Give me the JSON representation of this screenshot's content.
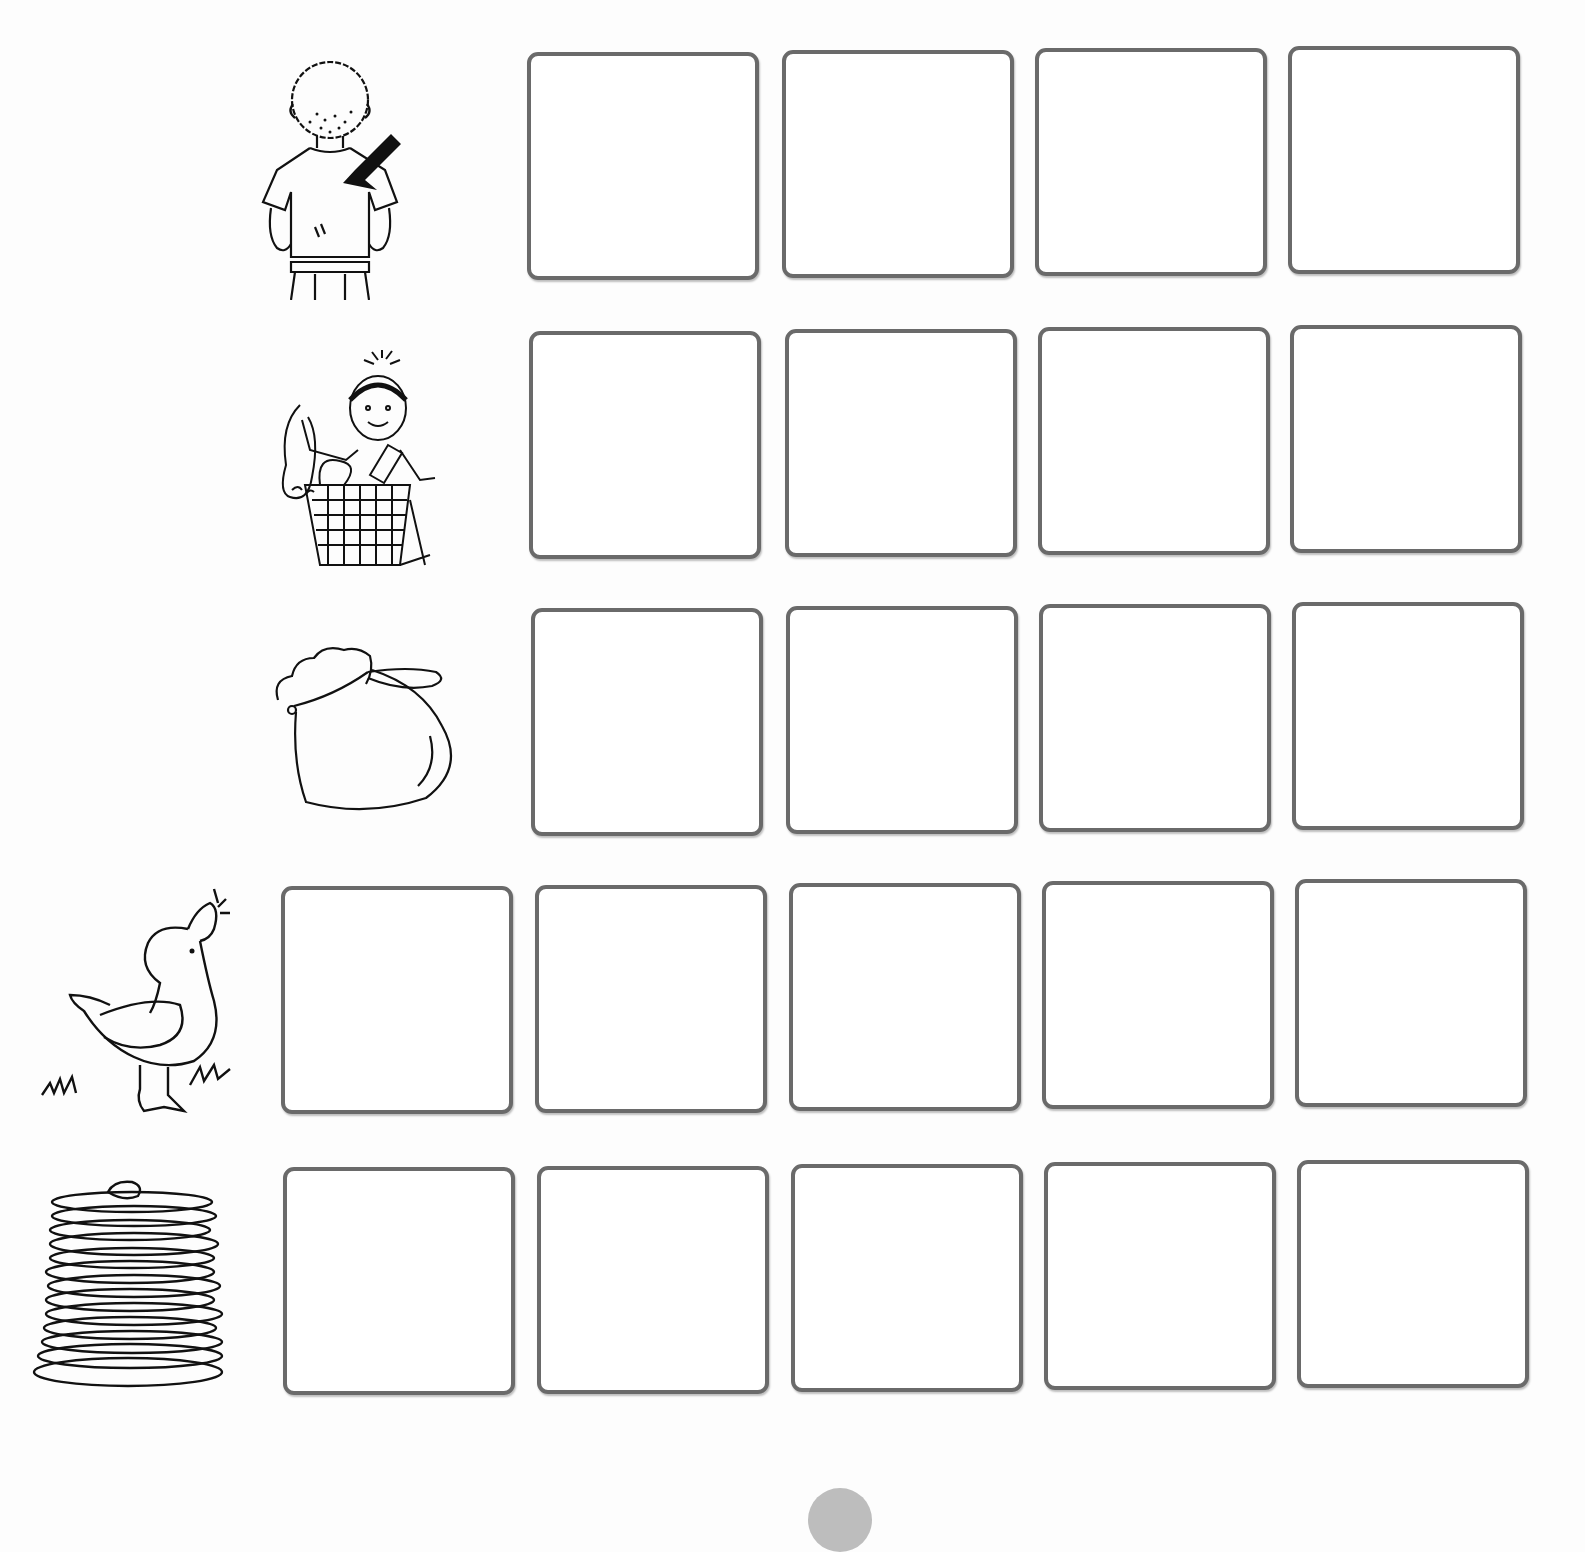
{
  "worksheet": {
    "heading_cropped": "",
    "rows": [
      {
        "picture": "boy-back-with-arrow",
        "picture_label": "back",
        "box_count": 4,
        "boxes": [
          "",
          "",
          "",
          ""
        ]
      },
      {
        "picture": "girl-unpacking-basket",
        "picture_label": "unpack",
        "box_count": 4,
        "boxes": [
          "",
          "",
          "",
          ""
        ]
      },
      {
        "picture": "drawstring-sack",
        "picture_label": "sack",
        "box_count": 4,
        "boxes": [
          "",
          "",
          "",
          ""
        ]
      },
      {
        "picture": "duck-quacking",
        "picture_label": "quack",
        "box_count": 5,
        "boxes": [
          "",
          "",
          "",
          "",
          ""
        ]
      },
      {
        "picture": "stack-of-pancakes",
        "picture_label": "stack",
        "box_count": 5,
        "boxes": [
          "",
          "",
          "",
          "",
          ""
        ]
      }
    ],
    "colors": {
      "box_border": "#6a6a6a",
      "background": "#fdfdfd",
      "page_badge": "#bdbdbd"
    }
  }
}
